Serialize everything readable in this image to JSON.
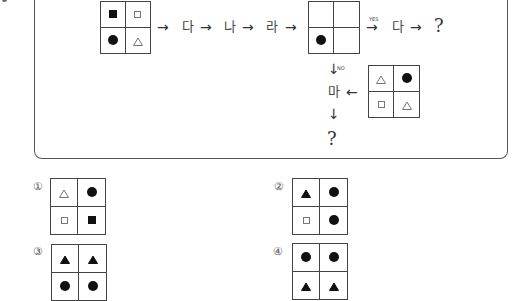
{
  "flow": {
    "start_grid": [
      "filled-square",
      "empty-square",
      "filled-circle",
      "empty-triangle"
    ],
    "steps": [
      "다",
      "나",
      "라"
    ],
    "condition_grid": [
      "",
      "",
      "filled-circle",
      ""
    ],
    "yes_label": "YES",
    "no_label": "NO",
    "yes_step": "다",
    "yes_result": "?",
    "no_step": "마",
    "no_result": "?",
    "side_grid": [
      "empty-triangle",
      "filled-circle",
      "empty-square",
      "empty-triangle"
    ]
  },
  "options": [
    {
      "number": "①",
      "cells": [
        "empty-triangle",
        "filled-circle",
        "empty-square",
        "filled-square"
      ]
    },
    {
      "number": "②",
      "cells": [
        "filled-triangle",
        "filled-circle",
        "empty-square",
        "filled-circle"
      ]
    },
    {
      "number": "③",
      "cells": [
        "filled-triangle",
        "filled-triangle",
        "filled-circle",
        "filled-circle"
      ]
    },
    {
      "number": "④",
      "cells": [
        "filled-circle",
        "filled-circle",
        "filled-triangle",
        "filled-triangle"
      ]
    }
  ],
  "arrows": {
    "right": "→",
    "down": "↓",
    "left": "←"
  }
}
